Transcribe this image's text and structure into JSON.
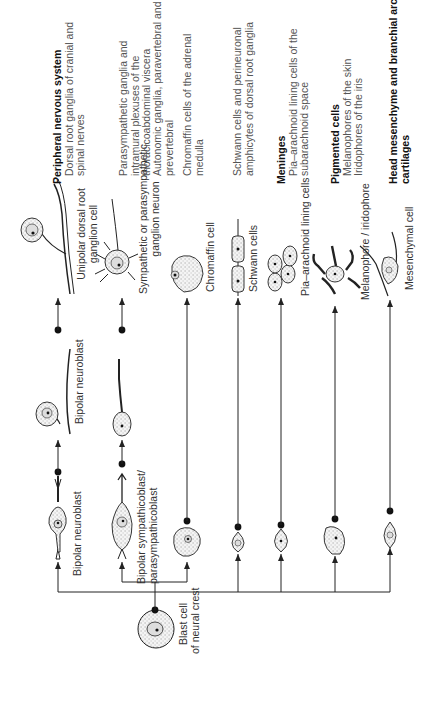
{
  "diagram": {
    "type": "cell-lineage-flowchart",
    "orientation": "rotated-90-ccw",
    "root": {
      "label_line1": "Blast cell",
      "label_line2": "of neural crest"
    },
    "intermediates": {
      "bipolar_neuroblast_1": "Bipolar neuroblast",
      "bipolar_neuroblast_2": "Bipolar neuroblast",
      "sympathicoblast_line1": "Bipolar sympathicoblast/",
      "sympathicoblast_line2": "parasympathicoblast"
    },
    "terminal_cells": {
      "unipolar_line1": "Unipolar dorsal root",
      "unipolar_line2": "ganglion cell",
      "ganglion_neuron_line1": "Sympathetic or parasympathetic",
      "ganglion_neuron_line2": "ganglion neuron",
      "chromaffin": "Chromaffin cell",
      "schwann": "Schwann cells",
      "pia_arachnoid": "Pia–arachnoid lining cells",
      "melanophore": "Melanophore / iridophore",
      "mesenchymal": "Mesenchymal cell"
    },
    "derivatives": {
      "pns_title": "Peripheral nervous system",
      "pns_line1": "Dorsal root ganglia of cranial and",
      "pns_line2": "spinal nerves",
      "para_line1": "Parasympathetic ganglia and",
      "para_line2": "intramural plexuses of the",
      "para_line3": "thoracicoabdominal viscera",
      "auto_line1": "Autonomic ganglia, paravertebral and",
      "auto_line2": "prevertebral",
      "chrom_line1": "Chromaffin cells of the adrenal",
      "chrom_line2": "medulla",
      "schwann_line1": "Schwann cells and perineuronal",
      "schwann_line2": "amphicytes of dorsal root ganglia",
      "meninges_title": "Meninges",
      "meninges_line1": "Pia–arachnoid lining cells of the",
      "meninges_line2": "subarachnoid space",
      "pigment_title": "Pigmented cells",
      "pigment_line1": "Melanophores of the skin",
      "pigment_line2": "Iridophores of the iris",
      "head_title_line1": "Head mesenchyme and branchial arch",
      "head_title_line2": "cartilages"
    },
    "colors": {
      "line": "#222222",
      "cell_fill": "#eeeeee",
      "text": "#333333"
    }
  }
}
